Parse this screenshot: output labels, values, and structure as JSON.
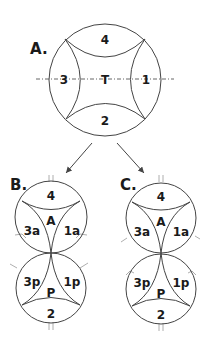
{
  "panels": {
    "A": {
      "label": "A.",
      "regions": {
        "top": "4",
        "left": "3",
        "center": "T",
        "right": "1",
        "bottom": "2"
      }
    },
    "B": {
      "label": "B.",
      "upper": {
        "top": "4",
        "left": "3a",
        "center": "A",
        "right": "1a"
      },
      "lower": {
        "left": "3p",
        "center": "P",
        "right": "1p",
        "bottom": "2"
      }
    },
    "C": {
      "label": "C.",
      "upper": {
        "top": "4",
        "left": "3a",
        "center": "A",
        "right": "1a"
      },
      "lower": {
        "left": "3p",
        "center": "P",
        "right": "1p",
        "bottom": "2"
      }
    }
  },
  "colors": {
    "line": "#444444",
    "text": "#1a1a1a",
    "background": "#ffffff"
  }
}
